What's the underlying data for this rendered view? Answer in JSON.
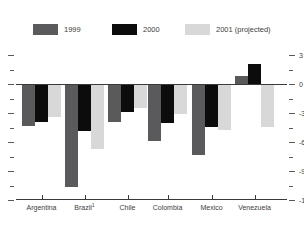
{
  "legend": [
    {
      "label": "1999",
      "color": "#5a5a5c"
    },
    {
      "label": "2000",
      "color": "#0c0c0c"
    },
    {
      "label": "2001 (projected)",
      "color": "#d8d8d8"
    }
  ],
  "chart_data": {
    "type": "bar",
    "title": "",
    "categories": [
      {
        "label": "Argentina"
      },
      {
        "label": "Brazil",
        "footnote": "1"
      },
      {
        "label": "Chile"
      },
      {
        "label": "Colombia"
      },
      {
        "label": "Mexico"
      },
      {
        "label": "Venezuela"
      }
    ],
    "series": [
      {
        "name": "1999",
        "color": "#5a5a5c",
        "values": [
          -4.2,
          -10.5,
          -3.8,
          -5.8,
          -7.2,
          0.8
        ]
      },
      {
        "name": "2000",
        "color": "#0c0c0c",
        "values": [
          -3.8,
          -4.8,
          -2.8,
          -3.9,
          -4.3,
          2.1
        ]
      },
      {
        "name": "2001 (projected)",
        "color": "#d8d8d8",
        "values": [
          -3.3,
          -6.6,
          -2.4,
          -3.0,
          -4.7,
          -4.3
        ]
      }
    ],
    "ylim": [
      -12,
      3
    ],
    "yticks_major": [
      3,
      0,
      -3,
      -6,
      -9,
      -12
    ],
    "yticks_minor": [
      1.5,
      -1.5,
      -4.5,
      -7.5,
      -10.5
    ],
    "ytick_label_side": "right",
    "grid": false,
    "legend_position": "top",
    "xlabel": "",
    "ylabel": ""
  }
}
